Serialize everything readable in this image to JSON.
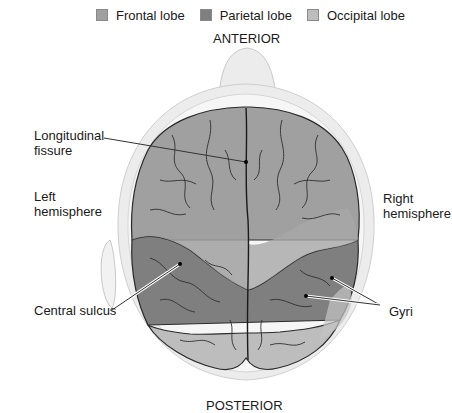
{
  "legend": {
    "items": [
      {
        "label": "Frontal lobe",
        "color": "#a0a0a0"
      },
      {
        "label": "Parietal lobe",
        "color": "#7f7f7f"
      },
      {
        "label": "Occipital lobe",
        "color": "#bdbdbd"
      }
    ]
  },
  "orientation": {
    "top": "ANTERIOR",
    "bottom": "POSTERIOR"
  },
  "labels": {
    "longitudinal_fissure_line1": "Longitudinal",
    "longitudinal_fissure_line2": "fissure",
    "left_hemisphere_line1": "Left",
    "left_hemisphere_line2": "hemisphere",
    "right_hemisphere_line1": "Right",
    "right_hemisphere_line2": "hemisphere",
    "central_sulcus": "Central sulcus",
    "gyri": "Gyri"
  },
  "colors": {
    "head_outline": "#e4e4e4",
    "frontal": "#a0a0a0",
    "parietal": "#7f7f7f",
    "occipital": "#bdbdbd",
    "sulcus_lines": "#2a2a2a"
  }
}
